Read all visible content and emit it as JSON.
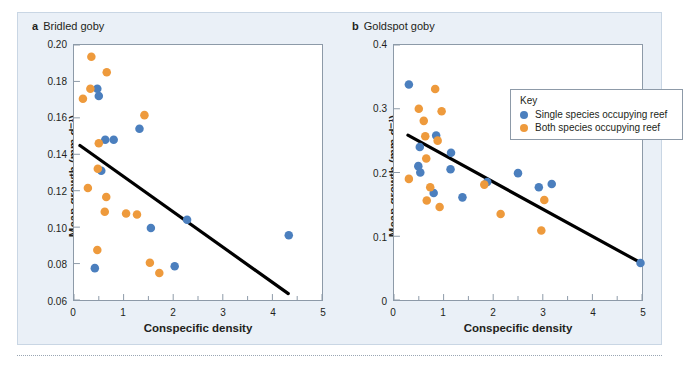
{
  "figure": {
    "background_color": "#eaf0f7",
    "series_colors": {
      "single_species": "#4B7FBE",
      "both_species": "#EE9A3C",
      "trendline": "#000000"
    },
    "legend": {
      "title": "Key",
      "entries": [
        {
          "label": "Single species occupying reef",
          "color": "#4B7FBE",
          "marker": "filled-circle"
        },
        {
          "label": "Both species occupying reef",
          "color": "#EE9A3C",
          "marker": "filled-circle"
        }
      ]
    }
  },
  "panels": [
    {
      "letter": "a",
      "title": "Bridled goby",
      "xlabel": "Conspecific density",
      "ylabel": "Mean growth (mm d⁻¹)",
      "xticks": [
        "0",
        "1",
        "2",
        "3",
        "4",
        "5"
      ],
      "yticks": [
        "0.06",
        "0.08",
        "0.10",
        "0.12",
        "0.14",
        "0.16",
        "0.18",
        "0.20"
      ]
    },
    {
      "letter": "b",
      "title": "Goldspot goby",
      "xlabel": "Conspecific density",
      "ylabel": "Mean growth (mm d⁻¹)",
      "xticks": [
        "0",
        "1",
        "2",
        "3",
        "4",
        "5"
      ],
      "yticks": [
        "0",
        "0.1",
        "0.2",
        "0.3",
        "0.4"
      ]
    }
  ],
  "chart_data": [
    {
      "type": "scatter",
      "panel": "a",
      "title": "Bridled goby",
      "xlabel": "Conspecific density",
      "ylabel": "Mean growth (mm d-1)",
      "xlim": [
        0,
        5
      ],
      "ylim": [
        0.06,
        0.2
      ],
      "xticks": [
        0,
        1,
        2,
        3,
        4,
        5
      ],
      "yticks": [
        0.06,
        0.08,
        0.1,
        0.12,
        0.14,
        0.16,
        0.18,
        0.2
      ],
      "grid": false,
      "legend_position": "none",
      "series": [
        {
          "name": "Single species occupying reef",
          "color": "#4B7FBE",
          "points": [
            [
              0.47,
              0.176
            ],
            [
              0.5,
              0.172
            ],
            [
              0.63,
              0.148
            ],
            [
              0.8,
              0.148
            ],
            [
              0.55,
              0.131
            ],
            [
              1.32,
              0.154
            ],
            [
              2.28,
              0.104
            ],
            [
              1.55,
              0.0995
            ],
            [
              2.03,
              0.0785
            ],
            [
              0.42,
              0.0775
            ],
            [
              4.33,
              0.0955
            ]
          ]
        },
        {
          "name": "Both species occupying reef",
          "color": "#EE9A3C",
          "points": [
            [
              0.35,
              0.1935
            ],
            [
              0.66,
              0.185
            ],
            [
              0.33,
              0.176
            ],
            [
              0.18,
              0.1705
            ],
            [
              1.42,
              0.1615
            ],
            [
              0.5,
              0.146
            ],
            [
              0.48,
              0.132
            ],
            [
              0.28,
              0.1215
            ],
            [
              0.65,
              0.1165
            ],
            [
              0.62,
              0.1085
            ],
            [
              1.05,
              0.1075
            ],
            [
              1.27,
              0.107
            ],
            [
              0.47,
              0.0875
            ],
            [
              1.53,
              0.0805
            ],
            [
              1.72,
              0.0748
            ]
          ]
        }
      ],
      "trendline": {
        "name": "Linear fit",
        "color": "#000000",
        "x_start": 0.12,
        "y_start": 0.1448,
        "x_end": 4.32,
        "y_end": 0.0635
      }
    },
    {
      "type": "scatter",
      "panel": "b",
      "title": "Goldspot goby",
      "xlabel": "Conspecific density",
      "ylabel": "Mean growth (mm d-1)",
      "xlim": [
        0,
        5
      ],
      "ylim": [
        0,
        0.4
      ],
      "xticks": [
        0,
        1,
        2,
        3,
        4,
        5
      ],
      "yticks": [
        0,
        0.1,
        0.2,
        0.3,
        0.4
      ],
      "grid": false,
      "legend_position": "top-right-inside",
      "series": [
        {
          "name": "Single species occupying reef",
          "color": "#4B7FBE",
          "points": [
            [
              0.3,
              0.338
            ],
            [
              0.85,
              0.258
            ],
            [
              0.52,
              0.24
            ],
            [
              1.15,
              0.231
            ],
            [
              0.49,
              0.21
            ],
            [
              0.53,
              0.2
            ],
            [
              1.14,
              0.205
            ],
            [
              1.88,
              0.185
            ],
            [
              2.5,
              0.199
            ],
            [
              2.92,
              0.177
            ],
            [
              3.18,
              0.182
            ],
            [
              0.8,
              0.168
            ],
            [
              1.38,
              0.161
            ],
            [
              4.97,
              0.058
            ]
          ]
        },
        {
          "name": "Both species occupying reef",
          "color": "#EE9A3C",
          "points": [
            [
              0.83,
              0.331
            ],
            [
              0.5,
              0.3
            ],
            [
              0.96,
              0.296
            ],
            [
              0.6,
              0.281
            ],
            [
              0.63,
              0.257
            ],
            [
              0.88,
              0.25
            ],
            [
              0.65,
              0.222
            ],
            [
              0.3,
              0.19
            ],
            [
              0.73,
              0.177
            ],
            [
              1.82,
              0.181
            ],
            [
              0.66,
              0.156
            ],
            [
              3.03,
              0.157
            ],
            [
              0.92,
              0.146
            ],
            [
              2.15,
              0.135
            ],
            [
              2.97,
              0.109
            ]
          ]
        }
      ],
      "trendline": {
        "name": "Linear fit",
        "color": "#000000",
        "x_start": 0.28,
        "y_start": 0.2585,
        "x_end": 4.97,
        "y_end": 0.0585
      }
    }
  ]
}
